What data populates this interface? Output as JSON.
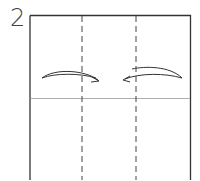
{
  "diagram": {
    "step_number": "2",
    "colors": {
      "line": "#333333",
      "crease": "#999999",
      "background": "#ffffff"
    },
    "elements": [
      {
        "type": "square-paper",
        "outline": "solid"
      },
      {
        "type": "valley-fold-line",
        "orientation": "vertical",
        "position": "left-third"
      },
      {
        "type": "valley-fold-line",
        "orientation": "vertical",
        "position": "right-third"
      },
      {
        "type": "crease-line",
        "orientation": "horizontal",
        "position": "middle"
      },
      {
        "type": "fold-arrow",
        "direction": "right",
        "from": "left-edge"
      },
      {
        "type": "fold-arrow",
        "direction": "left",
        "from": "right-edge"
      }
    ]
  }
}
